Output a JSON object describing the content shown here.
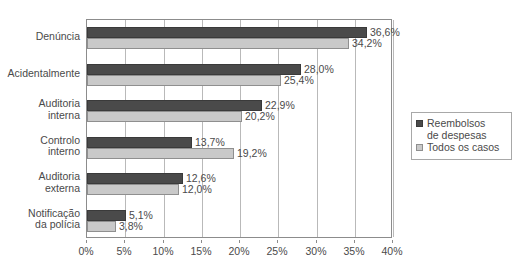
{
  "chart_data": {
    "type": "bar",
    "orientation": "horizontal",
    "title": "",
    "xlabel": "",
    "ylabel": "",
    "xlim": [
      0,
      40
    ],
    "xtick_labels": [
      "0%",
      "5%",
      "10%",
      "15%",
      "20%",
      "25%",
      "30%",
      "35%",
      "40%"
    ],
    "xtick_values": [
      0,
      5,
      10,
      15,
      20,
      25,
      30,
      35,
      40
    ],
    "grid": true,
    "legend_position": "right",
    "categories": [
      "Denúncia",
      "Acidentalmente",
      "Auditoria\ninterna",
      "Controlo\ninterno",
      "Auditoria\nexterna",
      "Notificação\nda polícia"
    ],
    "series": [
      {
        "name": "Reembolsos\nde despesas",
        "color": "#4a4a4a",
        "values": [
          36.6,
          28.0,
          22.9,
          13.7,
          12.6,
          5.1
        ],
        "labels": [
          "36,6%",
          "28,0%",
          "22,9%",
          "13,7%",
          "12,6%",
          "5,1%"
        ]
      },
      {
        "name": "Todos os casos",
        "color": "#c9c9c9",
        "values": [
          34.2,
          25.4,
          20.2,
          19.2,
          12.0,
          3.8
        ],
        "labels": [
          "34,2%",
          "25,4%",
          "20,2%",
          "19,2%",
          "12,0%",
          "3,8%"
        ]
      }
    ]
  },
  "legend": {
    "items": [
      {
        "label": "Reembolsos\nde despesas",
        "swatch": "dark"
      },
      {
        "label": "Todos os casos",
        "swatch": "light"
      }
    ]
  }
}
